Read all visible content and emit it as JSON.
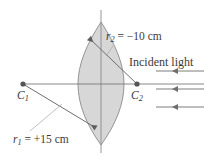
{
  "figure": {
    "kind": "optics-lens-ray-diagram",
    "canvas": {
      "width": 204,
      "height": 163,
      "background": "#ffffff"
    },
    "colors": {
      "line": "#6e6e6e",
      "axis": "#7a7a7a",
      "lens_fill": "#c9c9c9",
      "lens_stroke": "#8a8a8a",
      "text": "#3b3b3b",
      "leader": "#9a9a9a",
      "dot": "#555555"
    },
    "labels": {
      "r2": "r",
      "r2_sub": "2",
      "r2_value": " =  −10 cm",
      "r1": "r",
      "r1_sub": "1",
      "r1_value": " =  +15 cm",
      "incident_light": "Incident light",
      "c1": "C",
      "c1_sub": "1",
      "c2": "C",
      "c2_sub": "2"
    },
    "points": {
      "c1": {
        "x": 23,
        "y": 84,
        "name": "center-of-curvature-1"
      },
      "c2": {
        "x": 137,
        "y": 84,
        "name": "center-of-curvature-2"
      },
      "lens_top_tip": {
        "x": 101,
        "y": 22
      },
      "lens_bottom_tip": {
        "x": 101,
        "y": 145
      },
      "radius_arrow_1_tip": {
        "x": 88,
        "y": 37
      },
      "radius_arrow_2_tip": {
        "x": 97,
        "y": 129
      }
    },
    "optical_axis": {
      "x1": 22,
      "y1": 84,
      "x2": 204,
      "y2": 84
    },
    "lens_axis": {
      "x": 101,
      "y1": 10,
      "y2": 153
    },
    "incident_rays": [
      {
        "y": 71,
        "x_start": 204,
        "x_end": 156,
        "arrow": "left"
      },
      {
        "y": 89,
        "x_start": 204,
        "x_end": 156,
        "arrow": "left"
      },
      {
        "y": 107,
        "x_start": 204,
        "x_end": 156,
        "arrow": "left"
      }
    ],
    "radii": {
      "r1_cm": 15,
      "r1_sign": "+",
      "r2_cm": -10,
      "r2_sign": "−",
      "unit": "cm"
    }
  }
}
